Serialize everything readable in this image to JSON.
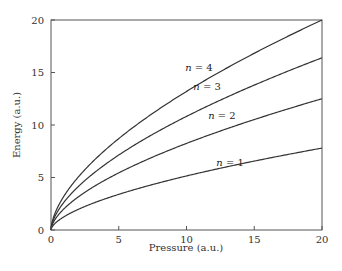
{
  "chart_data": {
    "type": "line",
    "title": "",
    "xlabel": "Pressure (a.u.)",
    "ylabel": "Energy (a.u.)",
    "xlim": [
      0,
      20
    ],
    "ylim": [
      0,
      20
    ],
    "xticks": [
      0,
      5,
      10,
      15,
      20
    ],
    "yticks": [
      0,
      5,
      10,
      15,
      20
    ],
    "grid": false,
    "legend": "inline labels",
    "x": [
      0,
      1,
      2,
      3,
      4,
      5,
      6,
      7,
      8,
      9,
      10,
      11,
      12,
      13,
      14,
      15,
      16,
      17,
      18,
      19,
      20
    ],
    "series": [
      {
        "name": "n = 1",
        "label_var": "n",
        "label_val": "1",
        "label_pos": [
          12.2,
          6.1
        ],
        "values": [
          0,
          1.29,
          1.95,
          2.49,
          2.96,
          3.39,
          3.79,
          4.17,
          4.53,
          4.87,
          5.15,
          5.52,
          5.83,
          6.13,
          6.42,
          6.71,
          6.99,
          7.26,
          7.53,
          7.79,
          7.8
        ]
      },
      {
        "name": "n = 2",
        "label_var": "n",
        "label_val": "2",
        "label_pos": [
          11.6,
          10.6
        ],
        "values": [
          0,
          2.07,
          3.13,
          3.99,
          4.74,
          5.43,
          6.08,
          6.69,
          7.26,
          7.81,
          8.25,
          8.85,
          9.34,
          9.82,
          10.29,
          10.75,
          11.2,
          11.64,
          12.07,
          12.49,
          12.5
        ]
      },
      {
        "name": "n = 3",
        "label_var": "n",
        "label_val": "3",
        "label_pos": [
          10.5,
          13.3
        ],
        "values": [
          0,
          2.72,
          4.11,
          5.24,
          6.22,
          7.12,
          7.97,
          8.77,
          9.52,
          10.24,
          10.82,
          11.6,
          12.25,
          12.88,
          13.49,
          14.1,
          14.69,
          15.26,
          15.83,
          16.38,
          16.4
        ]
      },
      {
        "name": "n = 4",
        "label_var": "n",
        "label_val": "4",
        "label_pos": [
          9.9,
          15.1
        ],
        "values": [
          0,
          3.32,
          5.01,
          6.39,
          7.59,
          8.69,
          9.72,
          10.69,
          11.61,
          12.49,
          13.2,
          14.15,
          14.94,
          15.71,
          16.45,
          17.19,
          17.91,
          18.61,
          19.3,
          19.98,
          20.0
        ]
      }
    ]
  }
}
